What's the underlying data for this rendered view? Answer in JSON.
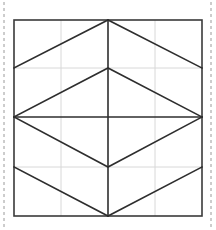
{
  "figure": {
    "canvas": {
      "width": 216,
      "height": 230
    },
    "colors": {
      "background": "#ffffff",
      "outline": "#3a3a3a",
      "diagonal": "#2e2e2e",
      "grid": "#d8d8d8",
      "guide": "#9a9a9a"
    },
    "square": {
      "left": 14,
      "top": 20,
      "right": 202,
      "bottom": 216,
      "stroke_width": 1.6
    },
    "grid": {
      "vertical_x": [
        61,
        108,
        155
      ],
      "horizontal_y": [
        68,
        117,
        167
      ],
      "stroke_width": 1
    },
    "guides": {
      "left_x": 4,
      "right_x": 211,
      "top": 2,
      "bottom": 228,
      "dash": "3,3",
      "stroke_width": 1
    },
    "vertices": {
      "top_apex": [
        108,
        20
      ],
      "bottom_apex": [
        108,
        216
      ],
      "left_mid": [
        14,
        117
      ],
      "right_mid": [
        202,
        117
      ],
      "inner_top": [
        108,
        68
      ],
      "inner_bottom": [
        108,
        167
      ],
      "left_upper": [
        14,
        68
      ],
      "right_upper": [
        202,
        68
      ],
      "left_lower": [
        14,
        167
      ],
      "right_lower": [
        202,
        167
      ]
    },
    "shapes": [
      {
        "name": "top-chevron-left",
        "points": "108,20 14,68"
      },
      {
        "name": "top-chevron-right",
        "points": "108,20 202,68"
      },
      {
        "name": "diamond-upper-left",
        "points": "108,68 14,117"
      },
      {
        "name": "diamond-upper-right",
        "points": "108,68 202,117"
      },
      {
        "name": "diamond-lower-left",
        "points": "14,117 108,167"
      },
      {
        "name": "diamond-lower-right",
        "points": "108,167 202,117"
      },
      {
        "name": "bottom-chevron-left",
        "points": "14,167 108,216"
      },
      {
        "name": "bottom-chevron-right",
        "points": "108,216 202,167"
      },
      {
        "name": "center-axis",
        "points": "108,20 108,216"
      },
      {
        "name": "horizontal-midline",
        "points": "14,117 202,117"
      }
    ]
  }
}
